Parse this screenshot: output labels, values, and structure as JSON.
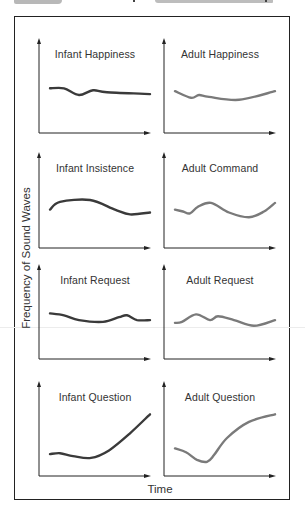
{
  "figure": {
    "ylabel": "Frequency of Sound Waves",
    "xlabel": "Time"
  },
  "colors": {
    "infant_curve": "#3a3a3a",
    "adult_curve": "#7a7a7a",
    "axes": "#222222"
  },
  "panels": [
    {
      "title": "Infant Happiness",
      "group": "infant"
    },
    {
      "title": "Adult Happiness",
      "group": "adult"
    },
    {
      "title": "Infant Insistence",
      "group": "infant"
    },
    {
      "title": "Adult Command",
      "group": "adult"
    },
    {
      "title": "Infant Request",
      "group": "infant"
    },
    {
      "title": "Adult Request",
      "group": "adult"
    },
    {
      "title": "Infant Question",
      "group": "infant"
    },
    {
      "title": "Adult Question",
      "group": "adult"
    }
  ],
  "chart_data": [
    {
      "type": "line",
      "title": "Infant Happiness",
      "xlabel": "Time",
      "ylabel": "Frequency of Sound Waves",
      "grid": false,
      "x": [
        0,
        0.14,
        0.29,
        0.43,
        0.57,
        1.0
      ],
      "values": [
        0.47,
        0.47,
        0.4,
        0.45,
        0.43,
        0.41
      ]
    },
    {
      "type": "line",
      "title": "Adult Happiness",
      "xlabel": "Time",
      "ylabel": "Frequency of Sound Waves",
      "grid": false,
      "x": [
        0,
        0.16,
        0.24,
        0.34,
        0.64,
        1.0
      ],
      "values": [
        0.44,
        0.37,
        0.4,
        0.38,
        0.35,
        0.44
      ]
    },
    {
      "type": "line",
      "title": "Infant Insistence",
      "xlabel": "Time",
      "ylabel": "Frequency of Sound Waves",
      "grid": false,
      "x": [
        0,
        0.1,
        0.4,
        0.65,
        0.8,
        1.0
      ],
      "values": [
        0.4,
        0.48,
        0.5,
        0.4,
        0.35,
        0.37
      ]
    },
    {
      "type": "line",
      "title": "Adult Command",
      "xlabel": "Time",
      "ylabel": "Frequency of Sound Waves",
      "grid": false,
      "x": [
        0,
        0.08,
        0.15,
        0.23,
        0.36,
        0.54,
        0.74,
        0.89,
        1.0
      ],
      "values": [
        0.4,
        0.38,
        0.36,
        0.43,
        0.47,
        0.37,
        0.32,
        0.38,
        0.47
      ]
    },
    {
      "type": "line",
      "title": "Infant Request",
      "xlabel": "Time",
      "ylabel": "Frequency of Sound Waves",
      "grid": false,
      "x": [
        0,
        0.14,
        0.29,
        0.53,
        0.69,
        0.77,
        0.87,
        1.0
      ],
      "values": [
        0.48,
        0.46,
        0.41,
        0.39,
        0.44,
        0.46,
        0.41,
        0.41
      ]
    },
    {
      "type": "line",
      "title": "Adult Request",
      "xlabel": "Time",
      "ylabel": "Frequency of Sound Waves",
      "grid": false,
      "x": [
        0,
        0.07,
        0.21,
        0.35,
        0.43,
        0.59,
        0.79,
        1.0
      ],
      "values": [
        0.38,
        0.39,
        0.47,
        0.41,
        0.45,
        0.41,
        0.35,
        0.41
      ]
    },
    {
      "type": "line",
      "title": "Infant Question",
      "xlabel": "Time",
      "ylabel": "Frequency of Sound Waves",
      "grid": false,
      "x": [
        0,
        0.1,
        0.23,
        0.41,
        0.59,
        0.8,
        1.0
      ],
      "values": [
        0.23,
        0.24,
        0.21,
        0.19,
        0.27,
        0.45,
        0.65
      ]
    },
    {
      "type": "line",
      "title": "Adult Question",
      "xlabel": "Time",
      "ylabel": "Frequency of Sound Waves",
      "grid": false,
      "x": [
        0,
        0.11,
        0.22,
        0.32,
        0.39,
        0.52,
        0.74,
        1.0
      ],
      "values": [
        0.29,
        0.25,
        0.17,
        0.15,
        0.22,
        0.4,
        0.57,
        0.65
      ]
    }
  ]
}
